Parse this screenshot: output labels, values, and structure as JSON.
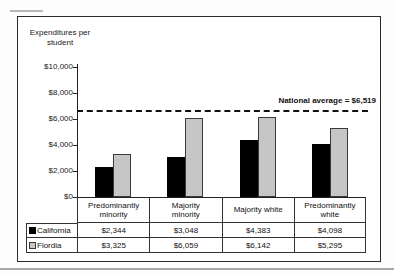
{
  "chart_data": {
    "type": "bar",
    "title": "Expenditures per student",
    "title_lines": [
      "Expenditures per",
      "student"
    ],
    "ylabel": "Expenditures per student",
    "xlabel": "",
    "ylim": [
      0,
      10000
    ],
    "y_tick_interval": 2000,
    "y_ticks": [
      "$10,000",
      "$8,000",
      "$6,000",
      "$4,000",
      "$2,000",
      "$0"
    ],
    "grid": false,
    "legend_position": "table-below",
    "categories": [
      {
        "label": "Predominantly minority",
        "lines": [
          "Predominantly",
          "minority"
        ]
      },
      {
        "label": "Majority minority",
        "lines": [
          "Majority",
          "minority"
        ]
      },
      {
        "label": "Majority white",
        "lines": [
          "Majority white"
        ]
      },
      {
        "label": "Predominantly white",
        "lines": [
          "Predominantly",
          "white"
        ]
      }
    ],
    "series": [
      {
        "name": "California",
        "color": "#000000",
        "values": [
          2344,
          3048,
          4383,
          4098
        ],
        "value_labels": [
          "$2,344",
          "$3,048",
          "$4,383",
          "$4,098"
        ]
      },
      {
        "name": "Flordia",
        "color": "#c6c6c6",
        "swatch_border": "#3a3a3a",
        "values": [
          3325,
          6059,
          6142,
          5295
        ],
        "value_labels": [
          "$3,325",
          "$6,059",
          "$6,142",
          "$5,295"
        ]
      }
    ],
    "reference_line": {
      "value": 6519,
      "label": "National average = $6,519",
      "style": "dashed",
      "color": "#111111"
    }
  }
}
